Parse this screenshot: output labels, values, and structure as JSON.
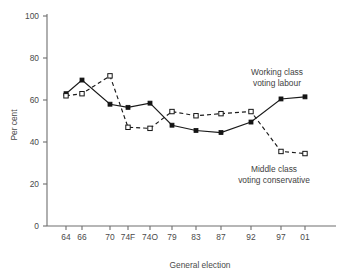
{
  "chart_data": {
    "type": "line",
    "title": "",
    "xlabel": "General election",
    "ylabel": "Per cent",
    "categories": [
      "64",
      "66",
      "70",
      "74F",
      "74O",
      "79",
      "83",
      "87",
      "92",
      "97",
      "01"
    ],
    "ylim": [
      0,
      100
    ],
    "yticks": [
      0,
      20,
      40,
      60,
      80,
      100
    ],
    "ytick_labels": [
      "0",
      "20",
      "40",
      "60",
      "80",
      "100"
    ],
    "grid": false,
    "legend_position": "inline-annotations",
    "series": [
      {
        "name": "Working class voting labour",
        "marker": "filled-square",
        "linestyle": "solid",
        "color": "#141414",
        "values": [
          63,
          69.5,
          58,
          56.5,
          58.5,
          48,
          45.5,
          44.5,
          49.5,
          60.5,
          61.5
        ]
      },
      {
        "name": "Middle class voting conservative",
        "marker": "open-square",
        "linestyle": "dashed",
        "color": "#141414",
        "values": [
          62,
          63,
          71.5,
          47,
          46.5,
          54.5,
          52.5,
          53.5,
          54.5,
          35.5,
          34.5
        ]
      }
    ],
    "annotations": [
      {
        "id": "working-class-label",
        "lines": [
          "Working class",
          "voting labour"
        ],
        "x": 277,
        "y": 75
      },
      {
        "id": "middle-class-label",
        "lines": [
          "Middle class",
          "voting conservative"
        ],
        "x": 274,
        "y": 172
      }
    ]
  },
  "axes": {
    "y_title": "Per cent",
    "x_title": "General election"
  }
}
